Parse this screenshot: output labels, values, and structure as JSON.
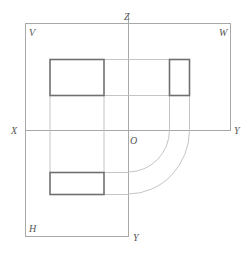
{
  "diagram": {
    "type": "orthographic-projection-three-view",
    "labels": {
      "z_axis": "Z",
      "v_plane": "V",
      "w_plane": "W",
      "x_axis": "X",
      "y_axis_right": "Y",
      "origin": "O",
      "h_plane": "H",
      "y_axis_bottom": "Y"
    },
    "views": [
      {
        "name": "front-view",
        "plane": "V",
        "shape": "rectangle"
      },
      {
        "name": "side-view",
        "plane": "W",
        "shape": "rectangle"
      },
      {
        "name": "top-view",
        "plane": "H",
        "shape": "rectangle"
      }
    ],
    "colors": {
      "projection_lines": "#bdbdbd",
      "frame": "#a8a8a8",
      "outlines": "#707070",
      "labels": "#555555"
    }
  }
}
